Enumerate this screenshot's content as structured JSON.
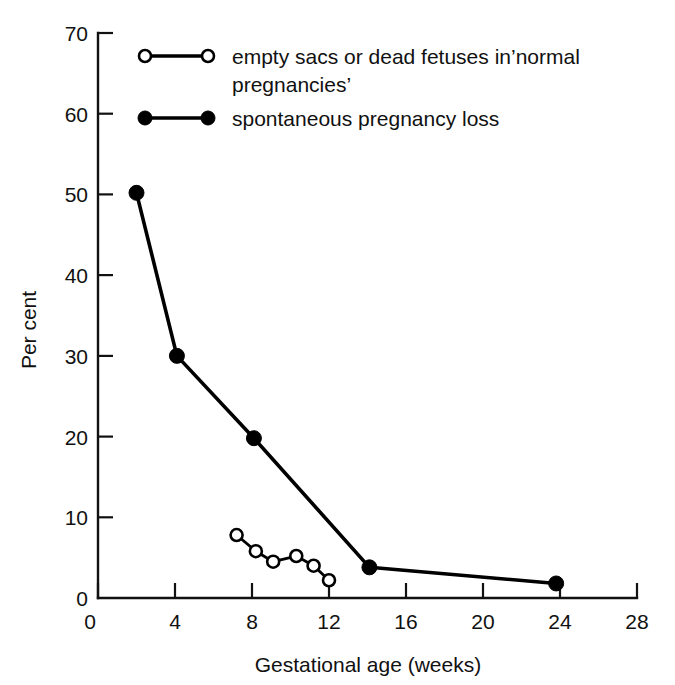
{
  "chart_data": {
    "type": "line",
    "title": "",
    "xlabel": "Gestational age (weeks)",
    "ylabel": "Per cent",
    "xlim": [
      0,
      28
    ],
    "ylim": [
      0,
      70
    ],
    "xticks": [
      0,
      4,
      8,
      12,
      16,
      20,
      24,
      28
    ],
    "yticks": [
      0,
      10,
      20,
      30,
      40,
      50,
      60,
      70
    ],
    "xtick_labels": [
      "0",
      "4",
      "8",
      "12",
      "16",
      "20",
      "24",
      "28"
    ],
    "ytick_labels": [
      "0",
      "10",
      "20",
      "30",
      "40",
      "50",
      "60",
      "70"
    ],
    "grid": false,
    "legend_position": "upper left",
    "series": [
      {
        "name": "empty sacs or dead fetuses in 'normal pregnancies'",
        "marker": "open-circle",
        "points": [
          {
            "x": 7.2,
            "y": 7.8
          },
          {
            "x": 8.2,
            "y": 5.8
          },
          {
            "x": 9.1,
            "y": 4.5
          },
          {
            "x": 10.3,
            "y": 5.2
          },
          {
            "x": 11.2,
            "y": 4.0
          },
          {
            "x": 12.0,
            "y": 2.2
          }
        ]
      },
      {
        "name": "spontaneous pregnancy loss",
        "marker": "filled-circle",
        "points": [
          {
            "x": 2.0,
            "y": 50.2
          },
          {
            "x": 4.1,
            "y": 30.0
          },
          {
            "x": 8.1,
            "y": 19.8
          },
          {
            "x": 14.1,
            "y": 3.8
          },
          {
            "x": 23.8,
            "y": 1.8
          }
        ]
      }
    ]
  },
  "legend": {
    "entries": [
      {
        "marker": "open-circle",
        "line1": "empty sacs or dead fetuses in’normal",
        "line2": "pregnancies’"
      },
      {
        "marker": "filled-circle",
        "line1": "spontaneous pregnancy loss",
        "line2": ""
      }
    ]
  },
  "colors": {
    "ink": "#000000",
    "background": "#ffffff"
  }
}
